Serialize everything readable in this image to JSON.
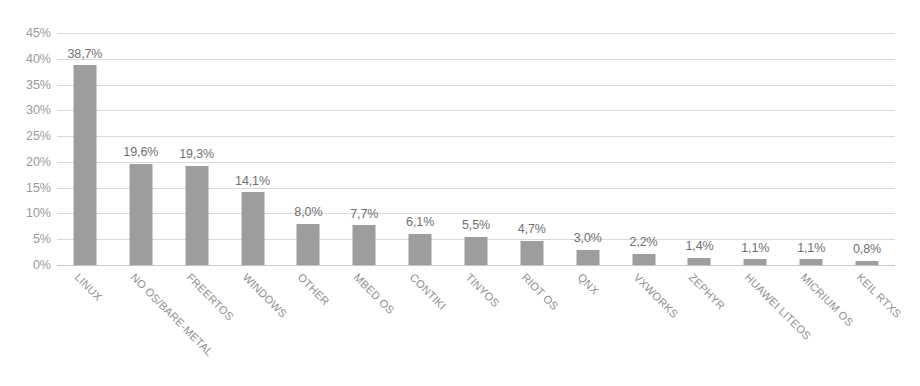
{
  "chart_data": {
    "type": "bar",
    "title": "",
    "xlabel": "",
    "ylabel": "",
    "categories": [
      "LINUX",
      "NO OS/BARE-METAL",
      "FREERTOS",
      "WINDOWS",
      "OTHER",
      "MBED OS",
      "CONTIKI",
      "TINYOS",
      "RIOT OS",
      "QNX",
      "VXWORKS",
      "ZEPHYR",
      "HUAWEI LITEOS",
      "MICRIUM OS",
      "KEIL RTXS"
    ],
    "values": [
      38.7,
      19.6,
      19.3,
      14.1,
      8.0,
      7.7,
      6.1,
      5.5,
      4.7,
      3.0,
      2.2,
      1.4,
      1.1,
      1.1,
      0.8
    ],
    "value_labels": [
      "38,7%",
      "19,6%",
      "19,3%",
      "14,1%",
      "8,0%",
      "7,7%",
      "6,1%",
      "5,5%",
      "4,7%",
      "3,0%",
      "2,2%",
      "1,4%",
      "1,1%",
      "1,1%",
      "0,8%"
    ],
    "ylim": [
      0,
      45
    ],
    "ytick_values": [
      0,
      5,
      10,
      15,
      20,
      25,
      30,
      35,
      40,
      45
    ],
    "ytick_labels": [
      "0%",
      "5%",
      "10%",
      "15%",
      "20%",
      "25%",
      "30%",
      "35%",
      "40%",
      "45%"
    ],
    "grid": true,
    "legend": "none",
    "bar_color": "#9d9d9d",
    "gridline_color": "#d9d9d9",
    "axis_text_color": "#9a9a9a",
    "value_text_color": "#6f6f6f",
    "background_color": "#ffffff"
  }
}
